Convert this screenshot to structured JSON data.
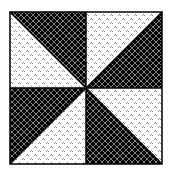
{
  "figure": {
    "type": "quilt-block",
    "pattern_name": "pinwheel",
    "colors": {
      "background": "#ffffff",
      "dark_fill": "#000000",
      "dark_lattice": "#7a7a7a",
      "light_fill": "#ffffff",
      "light_dots": "#8a8a8a",
      "outline": "#000000"
    },
    "quadrants": [
      {
        "position": "top-left",
        "dark": "upper-right",
        "light": "lower-left"
      },
      {
        "position": "top-right",
        "dark": "lower-right",
        "light": "upper-left"
      },
      {
        "position": "bottom-left",
        "dark": "upper-left",
        "light": "lower-right"
      },
      {
        "position": "bottom-right",
        "dark": "lower-left",
        "light": "upper-right"
      }
    ]
  }
}
